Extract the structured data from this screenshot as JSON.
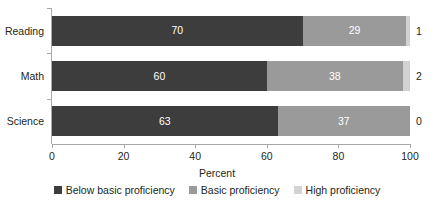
{
  "chart_data": {
    "type": "bar",
    "orientation": "horizontal",
    "stacked": true,
    "title": "",
    "xlabel": "Percent",
    "ylabel": "",
    "xlim": [
      0,
      100
    ],
    "xticks": [
      0,
      20,
      40,
      60,
      80,
      100
    ],
    "xticklabels": [
      "0",
      "20",
      "40",
      "60",
      "80",
      "100"
    ],
    "grid": false,
    "legend_position": "bottom",
    "categories": [
      "Reading",
      "Math",
      "Science"
    ],
    "series": [
      {
        "name": "Below basic proficiency",
        "color": "#3d3d3d",
        "values": [
          70,
          60,
          63
        ],
        "labels": [
          "70",
          "60",
          "63"
        ]
      },
      {
        "name": "Basic proficiency",
        "color": "#9a9a9a",
        "values": [
          29,
          38,
          37
        ],
        "labels": [
          "29",
          "38",
          "37"
        ]
      },
      {
        "name": "High proficiency",
        "color": "#d2d2d2",
        "values": [
          1,
          2,
          0
        ],
        "labels": [
          "1",
          "2",
          "0"
        ]
      }
    ],
    "rows": [
      {
        "category": "Reading",
        "segments": [
          {
            "series": "Below basic proficiency",
            "value": 70,
            "label": "70",
            "inside": true
          },
          {
            "series": "Basic proficiency",
            "value": 29,
            "label": "29",
            "inside": true
          },
          {
            "series": "High proficiency",
            "value": 1,
            "label": "1",
            "inside": false
          }
        ],
        "outside_label": "1"
      },
      {
        "category": "Math",
        "segments": [
          {
            "series": "Below basic proficiency",
            "value": 60,
            "label": "60",
            "inside": true
          },
          {
            "series": "Basic proficiency",
            "value": 38,
            "label": "38",
            "inside": true
          },
          {
            "series": "High proficiency",
            "value": 2,
            "label": "2",
            "inside": false
          }
        ],
        "outside_label": "2"
      },
      {
        "category": "Science",
        "segments": [
          {
            "series": "Below basic proficiency",
            "value": 63,
            "label": "63",
            "inside": true
          },
          {
            "series": "Basic proficiency",
            "value": 37,
            "label": "37",
            "inside": true
          },
          {
            "series": "High proficiency",
            "value": 0,
            "label": "0",
            "inside": false
          }
        ],
        "outside_label": "0"
      }
    ]
  },
  "axis": {
    "x_title": "Percent",
    "tick_labels": [
      "0",
      "20",
      "40",
      "60",
      "80",
      "100"
    ],
    "category_labels": [
      "Reading",
      "Math",
      "Science"
    ]
  },
  "legend": {
    "items": [
      {
        "label": "Below basic proficiency",
        "color": "#3d3d3d"
      },
      {
        "label": "Basic proficiency",
        "color": "#9a9a9a"
      },
      {
        "label": "High proficiency",
        "color": "#d2d2d2"
      }
    ]
  }
}
